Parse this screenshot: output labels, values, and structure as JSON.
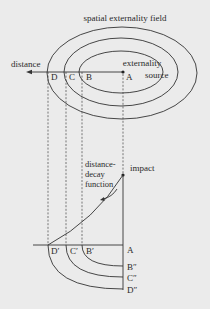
{
  "diagram": {
    "title": "spatial externality field",
    "labels": {
      "distance": "distance",
      "externality": "externality",
      "source": "source",
      "impact": "impact",
      "decay_line1": "distance-",
      "decay_line2": "decay",
      "decay_line3": "function"
    },
    "points_top": {
      "A": "A",
      "B": "B",
      "C": "C",
      "D": "D"
    },
    "points_bottom": {
      "A": "A",
      "B_prime": "B′",
      "C_prime": "C′",
      "D_prime": "D′",
      "B_dprime": "B″",
      "C_dprime": "C″",
      "D_dprime": "D″"
    },
    "colors": {
      "background": "#ebebeb",
      "ink": "#333333"
    }
  }
}
